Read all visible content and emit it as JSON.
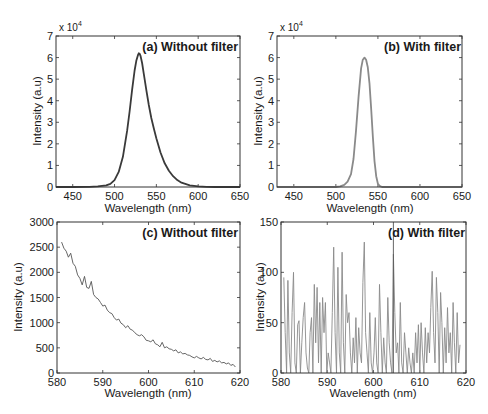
{
  "figure": {
    "width": 488,
    "height": 414,
    "background": "#ffffff",
    "axis_color": "#333333"
  },
  "chart_data": [
    {
      "id": "a",
      "type": "line",
      "title": "(a) Without filter",
      "xlabel": "Wavelength (nm)",
      "ylabel": "Intensity (a.u)",
      "y_multiplier_label": "x 10",
      "y_multiplier_exp": "4",
      "xlim": [
        430,
        650
      ],
      "ylim": [
        0,
        7
      ],
      "xticks": [
        450,
        500,
        550,
        600,
        650
      ],
      "yticks": [
        0,
        1,
        2,
        3,
        4,
        5,
        6,
        7
      ],
      "grid": false,
      "line_color": "#3a3a3a",
      "line_width": 1.8,
      "box": {
        "left": 56,
        "top": 36,
        "right": 240,
        "bottom": 187
      },
      "series": [
        {
          "name": "Without filter",
          "x": [
            430,
            450,
            470,
            480,
            490,
            495,
            500,
            505,
            510,
            515,
            518,
            521,
            524,
            526,
            528,
            529,
            530,
            531,
            533,
            535,
            538,
            541,
            544,
            547,
            550,
            555,
            560,
            565,
            570,
            575,
            580,
            590,
            600,
            610,
            620,
            650
          ],
          "y": [
            0,
            0,
            0.01,
            0.03,
            0.08,
            0.15,
            0.32,
            0.7,
            1.4,
            2.6,
            3.5,
            4.5,
            5.4,
            5.85,
            6.12,
            6.2,
            6.18,
            6.08,
            5.75,
            5.25,
            4.5,
            3.8,
            3.2,
            2.7,
            2.25,
            1.6,
            1.1,
            0.75,
            0.5,
            0.32,
            0.2,
            0.08,
            0.03,
            0.01,
            0,
            0
          ]
        }
      ],
      "peak": {
        "x": 529,
        "y": 6.2
      }
    },
    {
      "id": "b",
      "type": "line",
      "title": "(b) With filter",
      "xlabel": "Wavelength (nm)",
      "ylabel": "Intensity (a.u)",
      "y_multiplier_label": "x 10",
      "y_multiplier_exp": "4",
      "xlim": [
        430,
        650
      ],
      "ylim": [
        0,
        7
      ],
      "xticks": [
        450,
        500,
        550,
        600,
        650
      ],
      "yticks": [
        0,
        1,
        2,
        3,
        4,
        5,
        6,
        7
      ],
      "grid": false,
      "line_color": "#8a8a8a",
      "line_width": 1.8,
      "box": {
        "left": 277,
        "top": 36,
        "right": 462,
        "bottom": 187
      },
      "series": [
        {
          "name": "With filter",
          "x": [
            430,
            500,
            505,
            510,
            514,
            518,
            521,
            524,
            527,
            530,
            532,
            534,
            536,
            538,
            540,
            542,
            544,
            546,
            548,
            550,
            552,
            555,
            560,
            650
          ],
          "y": [
            0,
            0,
            0.03,
            0.1,
            0.25,
            0.6,
            1.3,
            2.6,
            4.2,
            5.5,
            5.9,
            6.0,
            5.9,
            5.55,
            4.8,
            3.6,
            2.3,
            1.2,
            0.5,
            0.15,
            0.05,
            0,
            0,
            0
          ]
        }
      ],
      "peak": {
        "x": 534,
        "y": 6.0
      }
    },
    {
      "id": "c",
      "type": "line",
      "title": "(c) Without filter",
      "xlabel": "Wavelength (nm)",
      "ylabel": "Intensity (a.u)",
      "xlim": [
        580,
        620
      ],
      "ylim": [
        0,
        3000
      ],
      "xticks": [
        580,
        590,
        600,
        610,
        620
      ],
      "yticks": [
        0,
        500,
        1000,
        1500,
        2000,
        2500,
        3000
      ],
      "grid": false,
      "line_color": "#555555",
      "line_width": 0.9,
      "box": {
        "left": 57,
        "top": 222,
        "right": 240,
        "bottom": 373
      },
      "series": [
        {
          "name": "Without filter",
          "x": [
            581.0,
            581.5,
            582.0,
            582.5,
            583.0,
            583.5,
            584.0,
            584.5,
            585.0,
            585.5,
            586.0,
            586.5,
            587.0,
            587.5,
            588.0,
            588.5,
            589.0,
            589.5,
            590.0,
            590.5,
            591.0,
            591.5,
            592.0,
            592.5,
            593.0,
            593.5,
            594.0,
            594.5,
            595.0,
            595.5,
            596.0,
            596.5,
            597.0,
            597.5,
            598.0,
            598.5,
            599.0,
            599.5,
            600.0,
            600.5,
            601.0,
            601.5,
            602.0,
            602.5,
            603.0,
            603.5,
            604.0,
            604.5,
            605.0,
            605.5,
            606.0,
            606.5,
            607.0,
            607.5,
            608.0,
            608.5,
            609.0,
            609.5,
            610.0,
            610.5,
            611.0,
            611.5,
            612.0,
            612.5,
            613.0,
            613.5,
            614.0,
            614.5,
            615.0,
            615.5,
            616.0,
            616.5,
            617.0,
            617.5,
            618.0,
            618.5,
            619.0
          ],
          "y": [
            2600,
            2480,
            2420,
            2300,
            2380,
            2180,
            2120,
            1950,
            1880,
            1750,
            1920,
            1700,
            1680,
            1820,
            1560,
            1500,
            1470,
            1400,
            1330,
            1350,
            1250,
            1200,
            1180,
            1100,
            1050,
            1070,
            990,
            960,
            900,
            940,
            870,
            850,
            800,
            760,
            740,
            760,
            720,
            650,
            640,
            620,
            660,
            580,
            560,
            520,
            610,
            500,
            520,
            480,
            470,
            440,
            460,
            400,
            420,
            380,
            390,
            360,
            350,
            320,
            300,
            330,
            300,
            280,
            310,
            270,
            260,
            290,
            230,
            250,
            220,
            240,
            200,
            210,
            180,
            200,
            150,
            170,
            120
          ]
        }
      ]
    },
    {
      "id": "d",
      "type": "line",
      "title": "(d) With filter",
      "xlabel": "Wavelength (nm)",
      "ylabel": "Intensity (a.u)",
      "xlim": [
        580,
        620
      ],
      "ylim": [
        0,
        150
      ],
      "xticks": [
        580,
        590,
        600,
        610,
        620
      ],
      "yticks": [
        0,
        50,
        100,
        150
      ],
      "grid": false,
      "line_color": "#8a8a8a",
      "line_width": 0.9,
      "box": {
        "left": 281,
        "top": 222,
        "right": 466,
        "bottom": 373
      },
      "vertical_marker": {
        "x": 604.3,
        "color": "#555555"
      },
      "series": [
        {
          "name": "With filter",
          "x": [
            580.6,
            580.9,
            581.2,
            581.5,
            581.8,
            582.1,
            582.4,
            582.7,
            583.0,
            583.3,
            583.6,
            583.9,
            584.2,
            584.5,
            584.8,
            585.1,
            585.4,
            585.7,
            586.0,
            586.3,
            586.6,
            586.9,
            587.2,
            587.5,
            587.8,
            588.1,
            588.4,
            588.7,
            589.0,
            589.3,
            589.6,
            589.9,
            590.2,
            590.5,
            590.8,
            591.1,
            591.4,
            591.7,
            592.0,
            592.3,
            592.6,
            592.9,
            593.2,
            593.5,
            593.8,
            594.1,
            594.4,
            594.7,
            595.0,
            595.3,
            595.6,
            595.9,
            596.2,
            596.5,
            596.8,
            597.1,
            597.4,
            597.7,
            598.0,
            598.3,
            598.6,
            598.9,
            599.2,
            599.5,
            599.8,
            600.1,
            600.4,
            600.7,
            601.0,
            601.3,
            601.6,
            601.9,
            602.2,
            602.5,
            602.8,
            603.1,
            603.4,
            603.7,
            604.0,
            604.3,
            604.6,
            604.9,
            605.2,
            605.5,
            605.8,
            606.1,
            606.4,
            606.7,
            607.0,
            607.3,
            607.6,
            607.9,
            608.2,
            608.5,
            608.8,
            609.1,
            609.4,
            609.7,
            610.0,
            610.3,
            610.6,
            610.9,
            611.2,
            611.5,
            611.8,
            612.1,
            612.4,
            612.7,
            613.0,
            613.3,
            613.6,
            613.9,
            614.2,
            614.5,
            614.8,
            615.1,
            615.4,
            615.7,
            616.0,
            616.3,
            616.6,
            616.9,
            617.2,
            617.5,
            617.8,
            618.1,
            618.4,
            618.7,
            619.0
          ],
          "y": [
            95,
            40,
            0,
            92,
            20,
            0,
            60,
            100,
            10,
            0,
            48,
            52,
            0,
            30,
            55,
            70,
            20,
            5,
            0,
            40,
            55,
            0,
            88,
            30,
            85,
            10,
            70,
            0,
            75,
            40,
            70,
            0,
            20,
            10,
            0,
            60,
            125,
            40,
            0,
            105,
            20,
            0,
            120,
            30,
            0,
            78,
            50,
            60,
            20,
            0,
            35,
            10,
            55,
            0,
            45,
            20,
            10,
            90,
            130,
            40,
            20,
            0,
            60,
            10,
            0,
            20,
            55,
            10,
            0,
            88,
            40,
            0,
            35,
            10,
            0,
            75,
            30,
            10,
            0,
            118,
            60,
            20,
            30,
            0,
            70,
            10,
            0,
            40,
            20,
            0,
            25,
            10,
            0,
            20,
            0,
            40,
            10,
            48,
            0,
            50,
            20,
            0,
            45,
            10,
            40,
            20,
            65,
            101,
            40,
            10,
            95,
            60,
            0,
            80,
            50,
            0,
            45,
            10,
            65,
            20,
            40,
            0,
            70,
            30,
            0,
            60,
            10,
            28
          ]
        }
      ]
    }
  ]
}
